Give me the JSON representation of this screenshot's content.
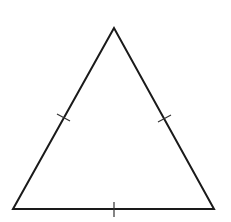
{
  "diagram": {
    "type": "equilateral-triangle",
    "vertices": {
      "apex": [
        114,
        28
      ],
      "bottom_left": [
        13,
        209
      ],
      "bottom_right": [
        214,
        209
      ]
    },
    "tick_marks": [
      {
        "side": "left",
        "count": 1
      },
      {
        "side": "right",
        "count": 1
      },
      {
        "side": "bottom",
        "count": 1
      }
    ],
    "stroke_color": "#1a1a1a",
    "background": "#ffffff"
  }
}
